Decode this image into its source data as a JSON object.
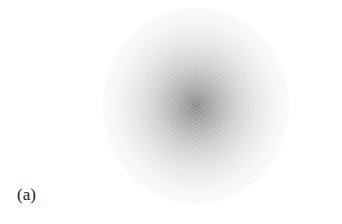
{
  "figure": {
    "panel_label": "(a)",
    "content": "gaussian-intensity-blob",
    "colors": {
      "background": "#ffffff",
      "blob_center": "#8c8c8c",
      "blob_edge": "#ffffff",
      "label": "#1a1a1a"
    }
  }
}
